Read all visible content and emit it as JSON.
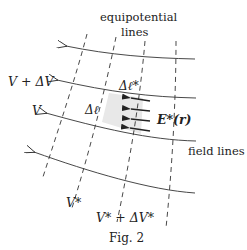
{
  "figure": {
    "caption": "Fig. 2",
    "labels": {
      "equipotential_line1": "equipotential",
      "equipotential_line2": "lines",
      "field_lines": "field lines",
      "v_plus_dv": "V + ΔV",
      "v": "V",
      "delta_l_star": "Δℓ*",
      "delta_l": "Δℓ",
      "e_star_r": "E*(r)",
      "v_star": "V*",
      "v_star_plus_dv_star": "V* + ΔV*"
    },
    "colors": {
      "line": "#333333",
      "shade": "#e6e6e6",
      "background": "#ffffff"
    }
  }
}
